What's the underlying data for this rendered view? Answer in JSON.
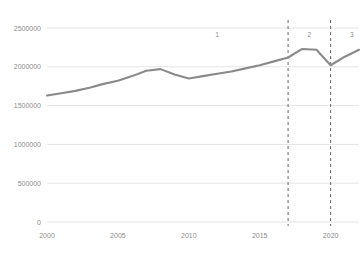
{
  "chart_data": {
    "type": "line",
    "title": "",
    "subtitle": "",
    "xlabel": "",
    "ylabel": "",
    "xlim": [
      2000,
      2022
    ],
    "ylim": [
      0,
      2500000
    ],
    "grid": true,
    "grid_axis": "y",
    "legend": false,
    "legend_position": "none",
    "line_color": "#8a8a8a",
    "grid_color": "#e4e4e4",
    "tick_label_color": "#8d8d8d",
    "background_color": "#ffffff",
    "x": [
      2000,
      2001,
      2002,
      2003,
      2004,
      2005,
      2006,
      2007,
      2008,
      2009,
      2010,
      2011,
      2012,
      2013,
      2014,
      2015,
      2016,
      2017,
      2018,
      2019,
      2020,
      2021,
      2022
    ],
    "values": [
      1630000,
      1660000,
      1690000,
      1730000,
      1780000,
      1820000,
      1880000,
      1950000,
      1970000,
      1900000,
      1850000,
      1880000,
      1910000,
      1940000,
      1980000,
      2020000,
      2070000,
      2120000,
      2230000,
      2220000,
      2020000,
      2130000,
      2220000
    ],
    "series": [
      {
        "name": "series-1",
        "values": [
          1630000,
          1660000,
          1690000,
          1730000,
          1780000,
          1820000,
          1880000,
          1950000,
          1970000,
          1900000,
          1850000,
          1880000,
          1910000,
          1940000,
          1980000,
          2020000,
          2070000,
          2120000,
          2230000,
          2220000,
          2020000,
          2130000,
          2220000
        ]
      }
    ],
    "ytick_labels": [
      "0",
      "500000",
      "1000000",
      "1500000",
      "2000000",
      "2500000"
    ],
    "ytick_values": [
      0,
      500000,
      1000000,
      1500000,
      2000000,
      2500000
    ],
    "xtick_labels": [
      "2000",
      "2005",
      "2010",
      "2015",
      "2020"
    ],
    "xtick_values": [
      2000,
      2005,
      2010,
      2015,
      2020
    ],
    "vlines": [
      {
        "name": "divider-2017",
        "x": 2017,
        "style": "dashed",
        "color": "#666666"
      },
      {
        "name": "divider-2020",
        "x": 2020,
        "style": "dashed",
        "color": "#666666"
      }
    ],
    "annotations": [
      {
        "name": "region-label-1",
        "label": "1",
        "x": 2012,
        "y": 2380000
      },
      {
        "name": "region-label-2",
        "label": "2",
        "x": 2018.5,
        "y": 2380000
      },
      {
        "name": "region-label-3",
        "label": "3",
        "x": 2021.5,
        "y": 2380000
      }
    ]
  }
}
